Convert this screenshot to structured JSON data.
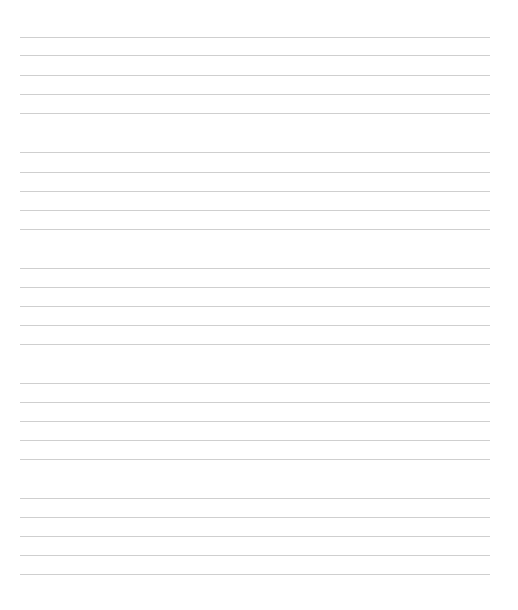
{
  "page": {
    "type": "blank-lined-paper",
    "background": "#ffffff",
    "line_color": "#cfcfcf",
    "line_left": 20,
    "line_right": 490,
    "groups": [
      {
        "lines": [
          37,
          55,
          75,
          94,
          113
        ]
      },
      {
        "lines": [
          152,
          172,
          191,
          210,
          229
        ]
      },
      {
        "lines": [
          268,
          287,
          306,
          325,
          344
        ]
      },
      {
        "lines": [
          383,
          402,
          421,
          440,
          459
        ]
      },
      {
        "lines": [
          498,
          517,
          536,
          555,
          574
        ]
      }
    ]
  }
}
